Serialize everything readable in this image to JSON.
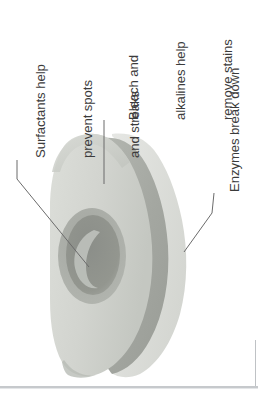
{
  "figure": {
    "orientation": "rotated-90-ccw",
    "background_color": "#ffffff",
    "text_color": "#3b3b3b",
    "leader_line_color": "#6b6b6b",
    "divider_color": "#c6c9cc"
  },
  "callouts": [
    {
      "id": "surfactants",
      "lines": [
        "Surfactants help",
        "prevent spots",
        "and streaks"
      ],
      "target": "inner-cavity",
      "leader_type": "stub-and-diagonal"
    },
    {
      "id": "bleach",
      "lines": [
        "Bleach and",
        "alkalines help",
        "remove stains"
      ],
      "target": "upper-body-layer",
      "leader_type": "vertical"
    },
    {
      "id": "enzymes",
      "lines": [
        "Enzymes break down",
        "food deposits"
      ],
      "target": "outer-stripe-band",
      "leader_type": "stub-and-diagonal"
    }
  ],
  "tablet": {
    "shape": "rounded-hexagonal-block",
    "layers": [
      {
        "name": "outer-body",
        "color": "#d5d7d2",
        "label": "outer body"
      },
      {
        "name": "top-face",
        "color": "#cbcdc8",
        "label": "top face"
      },
      {
        "name": "stripe-band",
        "color": "#a9aca6",
        "label": "stripe band"
      },
      {
        "name": "pale-band",
        "color": "#dfe0dc",
        "label": "pale band"
      },
      {
        "name": "cavity-ring",
        "color": "#9b9e99",
        "label": "cavity ring"
      },
      {
        "name": "cavity-core",
        "color": "#8e918c",
        "label": "cavity core"
      },
      {
        "name": "crescent",
        "color": "#b9bcb6",
        "label": "crescent highlight"
      }
    ]
  }
}
